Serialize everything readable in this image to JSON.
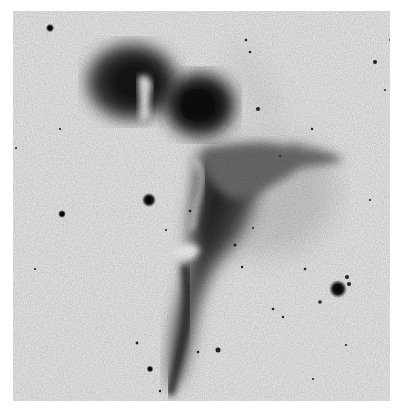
{
  "image": {
    "description": "Negative (inverted) astronomical photograph of a dark/emission nebula with stars shown as black dots on a light background",
    "caption": "Nebula negative photograph",
    "colors": {
      "background_border": "#ffffff",
      "sky": "#efefef",
      "nebula_dark": "#111111",
      "nebula_mid": "#555555"
    },
    "stars": [
      {
        "x": 50,
        "y": 28,
        "r": 3.2
      },
      {
        "x": 149,
        "y": 200,
        "r": 5.5
      },
      {
        "x": 62,
        "y": 214,
        "r": 3
      },
      {
        "x": 338,
        "y": 289,
        "r": 7
      },
      {
        "x": 347,
        "y": 277,
        "r": 2
      },
      {
        "x": 349,
        "y": 284,
        "r": 2
      },
      {
        "x": 320,
        "y": 302,
        "r": 1.8
      },
      {
        "x": 218,
        "y": 350,
        "r": 2.5
      },
      {
        "x": 150,
        "y": 369,
        "r": 2.6
      },
      {
        "x": 258,
        "y": 109,
        "r": 2
      },
      {
        "x": 375,
        "y": 62,
        "r": 2
      },
      {
        "x": 246,
        "y": 40,
        "r": 1.3
      },
      {
        "x": 250,
        "y": 52,
        "r": 1.3
      },
      {
        "x": 312,
        "y": 129,
        "r": 1.2
      },
      {
        "x": 235,
        "y": 245,
        "r": 1.5
      },
      {
        "x": 305,
        "y": 269,
        "r": 1.3
      },
      {
        "x": 273,
        "y": 309,
        "r": 1.3
      },
      {
        "x": 283,
        "y": 317,
        "r": 1.2
      },
      {
        "x": 198,
        "y": 352,
        "r": 1.3
      },
      {
        "x": 137,
        "y": 343,
        "r": 1.4
      },
      {
        "x": 242,
        "y": 267,
        "r": 1.2
      },
      {
        "x": 160,
        "y": 391,
        "r": 1.2
      },
      {
        "x": 313,
        "y": 379,
        "r": 1.1
      },
      {
        "x": 60,
        "y": 129,
        "r": 1.1
      },
      {
        "x": 35,
        "y": 269,
        "r": 1.1
      },
      {
        "x": 190,
        "y": 211,
        "r": 1.3
      },
      {
        "x": 166,
        "y": 230,
        "r": 1.1
      },
      {
        "x": 370,
        "y": 200,
        "r": 1.1
      },
      {
        "x": 390,
        "y": 40,
        "r": 1
      },
      {
        "x": 16,
        "y": 148,
        "r": 1
      },
      {
        "x": 385,
        "y": 90,
        "r": 1
      },
      {
        "x": 346,
        "y": 345,
        "r": 1
      },
      {
        "x": 253,
        "y": 228,
        "r": 1
      },
      {
        "x": 280,
        "y": 156,
        "r": 1
      }
    ]
  }
}
